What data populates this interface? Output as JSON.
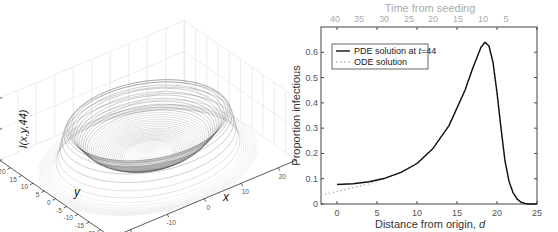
{
  "chart_data": [
    {
      "type": "surface3d",
      "title": "",
      "zlabel": "I(x,y,44)",
      "xlabel": "x",
      "ylabel": "y",
      "x_ticks": [
        "-20",
        "-10",
        "0",
        "10",
        "20"
      ],
      "y_ticks": [
        "25",
        "20",
        "15",
        "10",
        "5",
        "0",
        "-5",
        "-10",
        "-15",
        "-20",
        "-25"
      ],
      "z_ticks": [
        "0",
        "0.5",
        "1"
      ],
      "zlim": [
        0,
        1
      ],
      "description": "Ring-shaped (crater) surface: infection peak ~0.64 at radius ~18.5 from origin, low (~0.08) at center, falling to 0 beyond radius ~23"
    },
    {
      "type": "line",
      "title": "",
      "top_axis_label": "Time from seeding",
      "top_ticks": [
        "40",
        "35",
        "30",
        "25",
        "20",
        "15",
        "10",
        "5"
      ],
      "xlabel": "Distance from origin, d",
      "ylabel": "Proportion infectious",
      "xlim": [
        -2,
        25
      ],
      "ylim": [
        0,
        0.7
      ],
      "x_ticks": [
        "0",
        "5",
        "10",
        "15",
        "20",
        "25"
      ],
      "y_ticks": [
        "0",
        "0.1",
        "0.2",
        "0.3",
        "0.4",
        "0.5",
        "0.6"
      ],
      "legend": {
        "position": "upper left",
        "entries": [
          "PDE solution at t=44",
          "ODE solution"
        ]
      },
      "series": [
        {
          "name": "PDE solution at t=44",
          "style": "solid black",
          "x": [
            0,
            2,
            4,
            6,
            8,
            10,
            12,
            14,
            16,
            17,
            18,
            18.5,
            19,
            19.5,
            20,
            20.5,
            21,
            21.5,
            22,
            22.5,
            23,
            23.5,
            24,
            25
          ],
          "y": [
            0.077,
            0.08,
            0.088,
            0.102,
            0.125,
            0.16,
            0.22,
            0.31,
            0.45,
            0.54,
            0.62,
            0.64,
            0.625,
            0.56,
            0.44,
            0.3,
            0.17,
            0.09,
            0.045,
            0.02,
            0.007,
            0.002,
            0.0,
            0.0
          ]
        },
        {
          "name": "ODE solution",
          "style": "dotted light gray",
          "x": [
            -2,
            0,
            2,
            4,
            6,
            8,
            10,
            12,
            14,
            16,
            17,
            18,
            18.5,
            19,
            19.5,
            20,
            20.5,
            21,
            21.5,
            22,
            22.5,
            23,
            23.5,
            24,
            25
          ],
          "y": [
            0.035,
            0.05,
            0.065,
            0.08,
            0.1,
            0.125,
            0.16,
            0.22,
            0.31,
            0.45,
            0.54,
            0.62,
            0.64,
            0.625,
            0.56,
            0.44,
            0.3,
            0.17,
            0.09,
            0.045,
            0.02,
            0.007,
            0.002,
            0.0,
            0.0
          ]
        }
      ]
    }
  ],
  "labels": {
    "left_zlabel": "I(x,y,44)",
    "left_xlabel": "x",
    "left_ylabel": "y",
    "right_top": "Time from seeding",
    "right_xlabel_main": "Distance from origin, ",
    "right_xlabel_var": "d",
    "right_ylabel": "Proportion infectious",
    "legend_pde_main": "PDE solution at ",
    "legend_pde_var": "t",
    "legend_pde_end": "=44",
    "legend_ode": "ODE solution"
  }
}
